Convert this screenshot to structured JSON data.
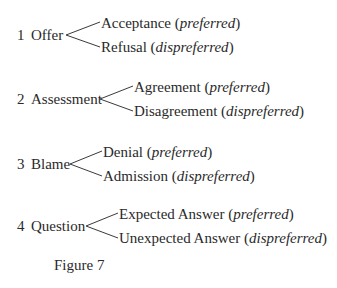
{
  "diagram": {
    "rows": [
      {
        "number": "1",
        "label": "Offer",
        "branches": [
          {
            "text": "Acceptance",
            "qualifier": "preferred"
          },
          {
            "text": "Refusal",
            "qualifier": "dispreferred"
          }
        ]
      },
      {
        "number": "2",
        "label": "Assessment",
        "branches": [
          {
            "text": "Agreement",
            "qualifier": "preferred"
          },
          {
            "text": "Disagreement",
            "qualifier": "dispreferred"
          }
        ]
      },
      {
        "number": "3",
        "label": "Blame",
        "branches": [
          {
            "text": "Denial",
            "qualifier": "preferred"
          },
          {
            "text": "Admission",
            "qualifier": "dispreferred"
          }
        ]
      },
      {
        "number": "4",
        "label": "Question",
        "branches": [
          {
            "text": "Expected Answer",
            "qualifier": "preferred"
          },
          {
            "text": "Unexpected Answer",
            "qualifier": "dispreferred"
          }
        ]
      }
    ],
    "caption": "Figure 7"
  }
}
